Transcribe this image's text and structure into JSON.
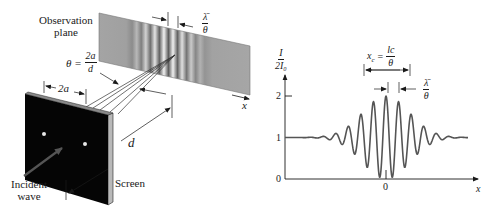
{
  "figure": {
    "left_panel": {
      "observation_plane_label": [
        "Observation",
        "plane"
      ],
      "fringe_spacing_label": {
        "numerator": "λ̄",
        "denominator": "θ"
      },
      "angle_label": {
        "lhs": "θ =",
        "numerator": "2a",
        "denominator": "d"
      },
      "slit_separation_label": "2a",
      "distance_label": "d",
      "x_axis_label": "x",
      "screen_label": "Screen",
      "incident_wave_label": [
        "Incident",
        "wave"
      ]
    },
    "right_panel": {
      "y_axis_label": {
        "numerator": "I",
        "denominator": "2I₀"
      },
      "coherence_length_label": {
        "lhs": "x",
        "lhs_sub": "c",
        "eq": "=",
        "numerator": "l",
        "numerator_sub": "c",
        "denominator": "θ"
      },
      "fringe_spacing_label": {
        "numerator": "λ̄",
        "denominator": "θ"
      },
      "y_ticks": [
        "0",
        "1",
        "2"
      ],
      "x_tick": "0",
      "x_axis_label": "x"
    },
    "colors": {
      "ink": "#1a1a1a",
      "curve": "#555555",
      "plane_gray": "#9e9e9e",
      "screen_black": "#050505"
    }
  },
  "chart_data": {
    "type": "line",
    "title": "",
    "xlabel": "x",
    "ylabel": "I / 2I0",
    "ylim": [
      0,
      2
    ],
    "yticks": [
      0,
      1,
      2
    ],
    "xticks": [
      0
    ],
    "x": [
      -9,
      -7,
      -6,
      -5,
      -4,
      -3,
      -2,
      -1,
      0,
      1,
      2,
      3,
      4,
      5,
      6,
      7,
      9
    ],
    "values": [
      1.0,
      1.0,
      0.9,
      1.35,
      0.55,
      1.6,
      0.3,
      1.85,
      2.0,
      1.85,
      0.3,
      1.6,
      0.55,
      1.35,
      0.9,
      1.0,
      1.0
    ],
    "annotations": [
      "xc = lc/θ",
      "λ̄/θ"
    ],
    "grid": false,
    "legend": "none"
  }
}
